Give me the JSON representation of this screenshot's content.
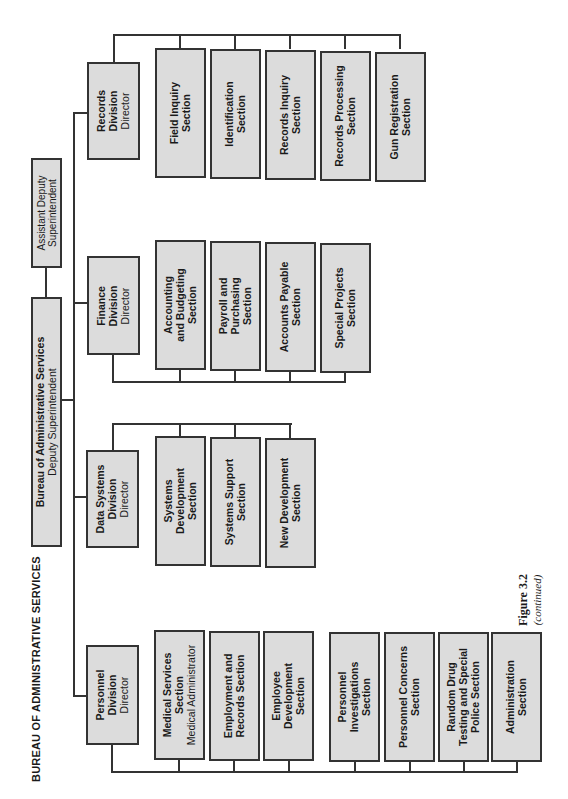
{
  "chart_title": "BUREAU OF ADMINISTRATIVE SERVICES",
  "figure": {
    "label": "Figure 3.2",
    "note": "(continued)"
  },
  "top": {
    "assistant": {
      "line1": "Assistant Deputy",
      "line2": "Superintendent"
    },
    "bureau": {
      "line1": "Bureau of Administrative Services",
      "line2": "Deputy Superintendent"
    }
  },
  "divisions": [
    {
      "name1": "Records",
      "name2": "Division",
      "role": "Director",
      "sections": [
        {
          "l1": "Field Inquiry",
          "l2": "Section"
        },
        {
          "l1": "Identification",
          "l2": "Section"
        },
        {
          "l1": "Records Inquiry",
          "l2": "Section"
        },
        {
          "l1": "Records Processing",
          "l2": "Section"
        },
        {
          "l1": "Gun Registration",
          "l2": "Section"
        }
      ]
    },
    {
      "name1": "Finance",
      "name2": "Division",
      "role": "Director",
      "sections": [
        {
          "l1": "Accounting",
          "l2": "and Budgeting",
          "l3": "Section"
        },
        {
          "l1": "Payroll and",
          "l2": "Purchasing",
          "l3": "Section"
        },
        {
          "l1": "Accounts Payable",
          "l2": "Section"
        },
        {
          "l1": "Special Projects",
          "l2": "Section"
        }
      ]
    },
    {
      "name1": "Data Systems",
      "name2": "Division",
      "role": "Director",
      "sections": [
        {
          "l1": "Systems",
          "l2": "Development",
          "l3": "Section"
        },
        {
          "l1": "Systems Support",
          "l2": "Section"
        },
        {
          "l1": "New Development",
          "l2": "Section"
        }
      ]
    },
    {
      "name1": "Personnel",
      "name2": "Division",
      "role": "Director",
      "sections": [
        {
          "l1": "Medical Services",
          "l2": "Section",
          "role": "Medical Administrator"
        },
        {
          "l1": "Employment and",
          "l2": "Records Section"
        },
        {
          "l1": "Employee",
          "l2": "Development",
          "l3": "Section"
        },
        {
          "l1": "Personnel",
          "l2": "Investigations",
          "l3": "Section"
        },
        {
          "l1": "Personnel Concerns",
          "l2": "Section"
        },
        {
          "l1": "Random Drug",
          "l2": "Testing and Special",
          "l3": "Police Section"
        },
        {
          "l1": "Administration",
          "l2": "Section"
        }
      ]
    }
  ],
  "colors": {
    "box_fill": "#dcdcdc",
    "border": "#333333",
    "background": "#ffffff"
  }
}
